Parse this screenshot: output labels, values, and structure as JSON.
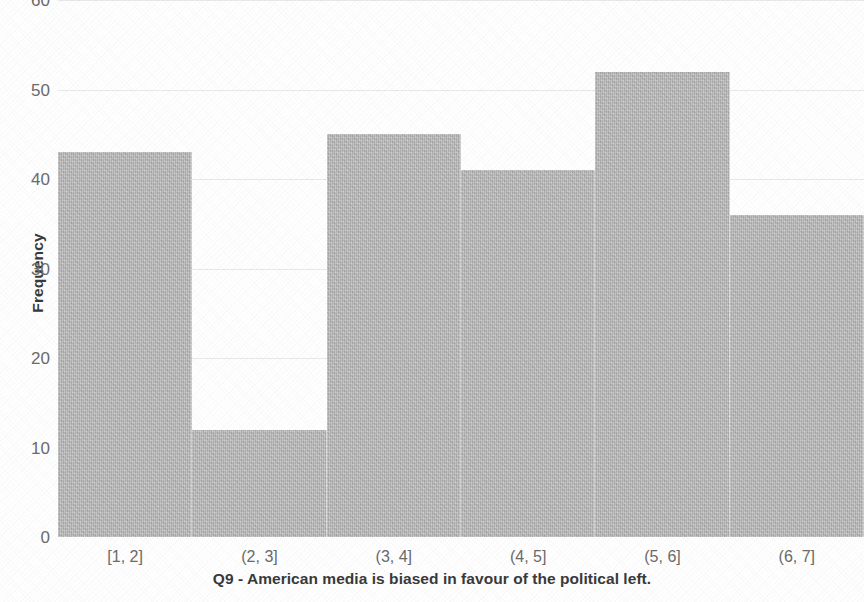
{
  "chart_data": {
    "type": "bar",
    "title": "",
    "xlabel": "Q9 - American media is biased in favour of the political left.",
    "ylabel": "Frequency",
    "categories": [
      "[1, 2]",
      "(2, 3]",
      "(3, 4]",
      "(4, 5]",
      "(5, 6]",
      "(6, 7]"
    ],
    "values": [
      43,
      12,
      45,
      41,
      52,
      36
    ],
    "ylim": [
      0,
      60
    ],
    "yticks": [
      0,
      10,
      20,
      30,
      40,
      50,
      60
    ],
    "ytick_labels": [
      "0",
      "10",
      "20",
      "30",
      "40",
      "50",
      "60"
    ],
    "grid": true,
    "legend": false,
    "bar_color": "#b9b9b9",
    "gridline_color": "#e9e9e9",
    "tick_label_color": "#6b6b6b",
    "axis_title_color": "#3a3a3a",
    "background_color": "#ffffff"
  }
}
